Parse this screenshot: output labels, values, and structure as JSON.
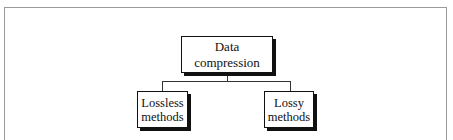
{
  "diagram": {
    "root": {
      "label": "Data compression"
    },
    "children": [
      {
        "label_line1": "Lossless",
        "label_line2": "methods"
      },
      {
        "label_line1": "Lossy",
        "label_line2": "methods"
      }
    ]
  }
}
